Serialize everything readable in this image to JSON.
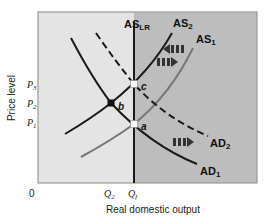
{
  "diagram": {
    "axes": {
      "ylabel": "Price level",
      "xlabel": "Real domestic output",
      "origin": "0"
    },
    "y_ticks": [
      {
        "label": "P",
        "sub": "3",
        "y": 84
      },
      {
        "label": "P",
        "sub": "2",
        "y": 103
      },
      {
        "label": "P",
        "sub": "1",
        "y": 122
      }
    ],
    "x_ticks": [
      {
        "label": "Q",
        "sub": "2",
        "x": 111
      },
      {
        "label": "Q",
        "sub": "f",
        "x": 134
      }
    ],
    "curves": {
      "as_lr": {
        "label": "AS",
        "sub": "LR"
      },
      "as2": {
        "label": "AS",
        "sub": "2"
      },
      "as1": {
        "label": "AS",
        "sub": "1"
      },
      "ad2": {
        "label": "AD",
        "sub": "2"
      },
      "ad1": {
        "label": "AD",
        "sub": "1"
      }
    },
    "points": {
      "a": "a",
      "b": "b",
      "c": "c"
    },
    "colors": {
      "left_region": "#e4e4e4",
      "right_region": "#bdbdbd",
      "curve_dark": "#1a1a1a",
      "curve_gray": "#777777",
      "arrow": "#333333"
    }
  }
}
